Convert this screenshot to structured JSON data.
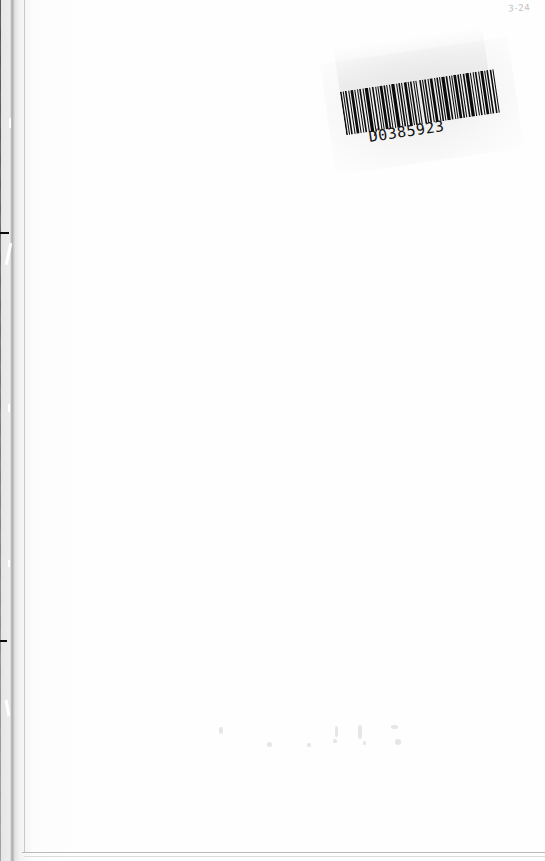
{
  "document": {
    "type": "scanned-book-page",
    "page_state": "blank",
    "width_px": 545,
    "height_px": 861,
    "paper_color": "#fefefe",
    "background_color": "#ffffff"
  },
  "barcode_label": {
    "name": "library-barcode-label",
    "number_text": "D0385923",
    "number_prefix": "D",
    "number_zero": "0",
    "number_suffix": "385923",
    "rotation_deg": -8.4,
    "bar_color": "#0a0a0a",
    "label_paper_color": "#ececec",
    "symbology": "linear-1d",
    "position": {
      "x": 337,
      "y": 58,
      "width": 170,
      "height": 98
    },
    "bar_pattern": [
      3,
      2,
      2,
      2,
      3,
      3,
      2,
      2,
      5,
      2,
      2,
      3,
      2,
      2,
      3,
      3,
      2,
      2,
      6,
      2,
      2,
      3,
      3,
      3,
      2,
      2,
      2,
      2,
      5,
      2,
      3,
      2,
      2,
      3,
      2,
      2,
      6,
      3,
      2,
      2,
      3,
      2,
      2,
      3,
      5,
      2,
      2,
      2,
      3,
      3,
      2,
      2,
      2,
      5,
      3,
      2,
      2,
      2,
      3,
      3,
      2,
      2,
      5,
      3,
      2,
      2,
      3,
      2,
      2,
      2,
      6,
      2,
      3,
      3,
      2,
      2,
      2,
      2,
      5,
      2,
      3,
      2,
      2,
      3,
      3,
      2,
      6,
      2,
      2,
      3,
      2,
      2,
      3,
      3,
      2,
      2,
      5,
      2,
      2,
      2,
      3,
      3,
      3,
      2,
      2,
      5
    ]
  },
  "corner_mark": {
    "name": "handwritten-corner-mark",
    "text": "3-24",
    "color": "#969696",
    "position": {
      "x": 508,
      "y": 3
    }
  },
  "scan_gutter": {
    "name": "scan-gutter-shadow",
    "edge": "left",
    "color": "#050505",
    "width_top_px": 13,
    "width_bottom_px": 10
  },
  "page_edges": {
    "bottom_trim_color": "#b9b9b9",
    "gutter_trim_color": "#c9c9c9"
  },
  "bleed_through": {
    "name": "verso-bleed-through-specks",
    "color": "#dedede",
    "count": 9
  }
}
